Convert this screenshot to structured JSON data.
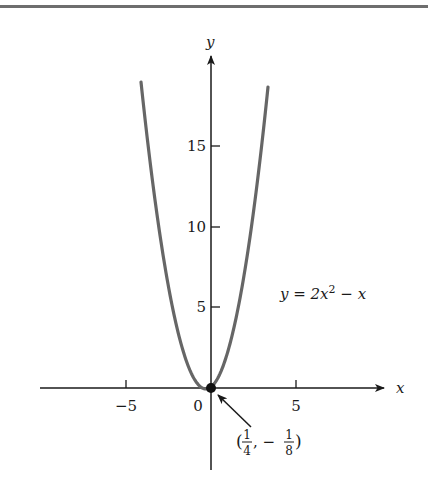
{
  "chart_data": {
    "type": "line",
    "title": "",
    "equation_label": "y = 2x² − x",
    "xlabel": "x",
    "ylabel": "y",
    "x_ticks": [
      -5,
      0,
      5
    ],
    "x_tick_labels": [
      "−5",
      "0",
      "5"
    ],
    "y_ticks": [
      5,
      10,
      15
    ],
    "y_tick_labels": [
      "5",
      "10",
      "15"
    ],
    "xlim": [
      -10,
      10
    ],
    "ylim": [
      -5,
      20
    ],
    "grid": false,
    "series": [
      {
        "name": "y = 2x^2 - x",
        "color": "#666666",
        "x": [
          -3.0,
          -2.5,
          -2.0,
          -1.5,
          -1.0,
          -0.5,
          0.0,
          0.25,
          0.5,
          1.0,
          1.5,
          2.0,
          2.5,
          3.0,
          3.5
        ],
        "y": [
          21.0,
          15.0,
          10.0,
          6.0,
          3.0,
          1.0,
          0.0,
          -0.125,
          0.0,
          1.0,
          3.0,
          6.0,
          10.0,
          15.0,
          21.0
        ]
      }
    ],
    "annotations": [
      {
        "point": [
          0.25,
          -0.125
        ],
        "text": "(1/4, −1/8)",
        "type": "arrow"
      }
    ]
  },
  "labels": {
    "x_axis": "x",
    "y_axis": "y",
    "equation": {
      "lhs": "y = 2x",
      "exp": "2",
      "rhs": " − x"
    },
    "vertex": {
      "open": "(",
      "n1": "1",
      "d1": "4",
      "sep": ", −",
      "n2": "1",
      "d2": "8",
      "close": ")"
    },
    "x_ticks": [
      "−5",
      "0",
      "5"
    ],
    "y_ticks": [
      "5",
      "10",
      "15"
    ]
  }
}
